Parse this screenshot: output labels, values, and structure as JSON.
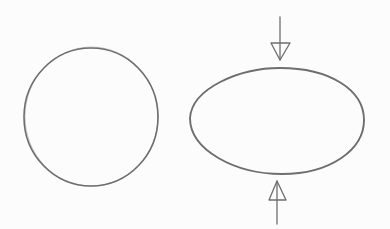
{
  "diagram": {
    "stroke_color": "#6e6e6e",
    "background": "#fcfcfc",
    "shapes": [
      {
        "name": "circle",
        "cx": 91,
        "cy": 117,
        "rx": 67,
        "ry": 69
      },
      {
        "name": "squashed-ellipse",
        "cx": 277,
        "cy": 121,
        "rx": 88,
        "ry": 53
      }
    ],
    "arrows": [
      {
        "name": "top-arrow",
        "direction": "down",
        "x": 280,
        "from_y": 17,
        "to_y": 60
      },
      {
        "name": "bottom-arrow",
        "direction": "up",
        "x": 277,
        "from_y": 224,
        "to_y": 181
      }
    ]
  }
}
